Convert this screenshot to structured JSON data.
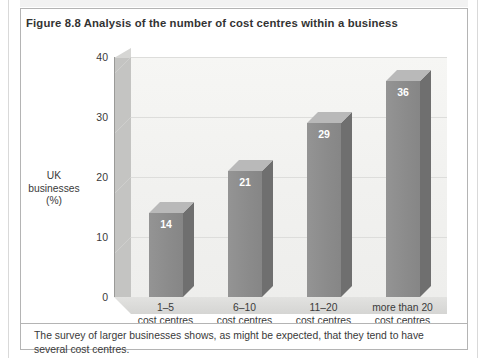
{
  "figure": {
    "title": "Figure 8.8  Analysis of the number of cost centres within a business",
    "caption": "The survey of larger businesses shows, as might be expected, that they tend to have several cost centres."
  },
  "chart_data": {
    "type": "bar",
    "title": "Figure 8.8  Analysis of the number of cost centres within a business",
    "categories": [
      "1–5\ncost centres",
      "6–10\ncost centres",
      "11–20\ncost centres",
      "more than 20\ncost centres"
    ],
    "category_lines": [
      [
        "1–5",
        "cost centres"
      ],
      [
        "6–10",
        "cost centres"
      ],
      [
        "11–20",
        "cost centres"
      ],
      [
        "more than 20",
        "cost centres"
      ]
    ],
    "values": [
      14,
      21,
      29,
      36
    ],
    "data_labels": [
      "14",
      "21",
      "29",
      "36"
    ],
    "xlabel": "",
    "ylabel": "UK businesses (%)",
    "ylabel_lines": [
      "UK",
      "businesses",
      "(%)"
    ],
    "ylim": [
      0,
      40
    ],
    "yticks": [
      0,
      10,
      20,
      30,
      40
    ],
    "ytick_labels": [
      "0",
      "10",
      "20",
      "30",
      "40"
    ],
    "grid": true,
    "legend": false,
    "style": "3d-column",
    "colors": {
      "bar_front": "#8d8d8d",
      "bar_top": "#b9b9b9",
      "bar_side": "#6f6f6f",
      "plot_background": "#f4f4f2",
      "wall": "#c4c4c2",
      "floor": "#dcdcda",
      "gridline": "#dddddb",
      "axis": "#9a9a98",
      "label_text": "#3a3a3a",
      "data_label_text": "#ffffff",
      "frame_border": "#b4b4b4"
    }
  }
}
